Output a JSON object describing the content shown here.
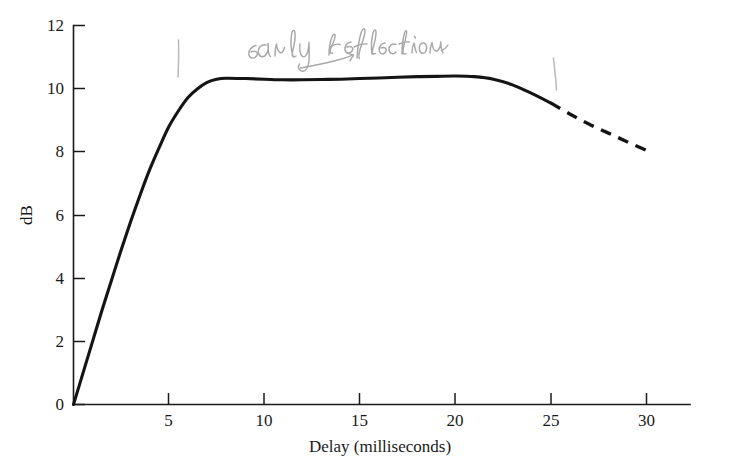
{
  "chart_data": {
    "type": "line",
    "title": "",
    "xlabel": "Delay (milliseconds)",
    "ylabel": "dB",
    "xlim": [
      0,
      32.3
    ],
    "ylim": [
      0,
      12
    ],
    "grid": false,
    "legend_position": "none",
    "xticks": [
      5,
      10,
      15,
      20,
      25,
      30
    ],
    "xtick_labels": [
      "5",
      "10",
      "15",
      "20",
      "25",
      "30"
    ],
    "yticks": [
      0,
      2,
      4,
      6,
      8,
      10,
      12
    ],
    "ytick_labels": [
      "0",
      "2",
      "4",
      "6",
      "8",
      "10",
      "12"
    ],
    "series": [
      {
        "name": "Cumulative early-reflection level",
        "style": "solid",
        "x": [
          0,
          0.5,
          1,
          1.5,
          2,
          2.5,
          3,
          3.5,
          4,
          4.5,
          5,
          5.5,
          6,
          6.5,
          7,
          7.5,
          8,
          9,
          10,
          11,
          12,
          13,
          14,
          15,
          16,
          17,
          18,
          19,
          20,
          21,
          22,
          23,
          24,
          25
        ],
        "y": [
          0,
          1.0,
          2.0,
          3.0,
          3.95,
          4.9,
          5.8,
          6.65,
          7.45,
          8.15,
          8.8,
          9.3,
          9.72,
          10.0,
          10.2,
          10.3,
          10.33,
          10.32,
          10.3,
          10.28,
          10.28,
          10.29,
          10.3,
          10.32,
          10.34,
          10.36,
          10.38,
          10.39,
          10.4,
          10.38,
          10.3,
          10.12,
          9.85,
          9.55
        ]
      },
      {
        "name": "Extrapolated decay",
        "style": "dashed",
        "x": [
          25,
          26,
          27,
          28,
          29,
          30
        ],
        "y": [
          9.55,
          9.2,
          8.88,
          8.6,
          8.32,
          8.05
        ]
      }
    ],
    "annotations": [
      {
        "name": "early-reflection-annotation",
        "text": "early reflection",
        "style": "handwritten-pencil",
        "x": 11.6,
        "y": 11.4
      },
      {
        "name": "pencil-tick-left",
        "text": "",
        "style": "handwritten-pencil-tick",
        "x": 5.5,
        "y": 10.8
      },
      {
        "name": "pencil-tick-right",
        "text": "",
        "style": "handwritten-pencil-tick",
        "x": 25.2,
        "y": 11.0
      }
    ]
  }
}
